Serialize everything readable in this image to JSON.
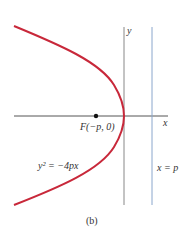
{
  "figure": {
    "caption": "(b)",
    "equation_label": "y² = −4px",
    "focus_label": "F(−p, 0)",
    "directrix_label": "x = p",
    "x_axis_label": "x",
    "y_axis_label": "y",
    "colors": {
      "parabola": "#c8283a",
      "directrix": "#8aa6cc",
      "axis": "#555555",
      "text": "#333333"
    }
  }
}
